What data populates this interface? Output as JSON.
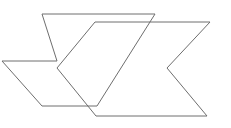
{
  "figure": {
    "canvas": {
      "width": 231,
      "height": 128,
      "background_color": "#ffffff"
    },
    "style": {
      "stroke_color": "#6e6e6e",
      "stroke_width": 1,
      "fill": "none"
    },
    "shapes": [
      {
        "name": "chevron-back",
        "label": "Back chevron",
        "stroke_color": "#6e6e6e",
        "stroke_width": 1,
        "fill": "none",
        "points": "42,14 155,14 97,106 42,106 2,61 57,61",
        "vertices": [
          {
            "name": "top-left",
            "x": 42,
            "y": 14
          },
          {
            "name": "top-right",
            "x": 155,
            "y": 14
          },
          {
            "name": "bottom-right",
            "x": 97,
            "y": 106
          },
          {
            "name": "bottom-left",
            "x": 42,
            "y": 106
          },
          {
            "name": "left-point",
            "x": 2,
            "y": 61
          },
          {
            "name": "inner-notch",
            "x": 57,
            "y": 61
          }
        ]
      },
      {
        "name": "chevron-front",
        "label": "Front chevron",
        "stroke_color": "#6e6e6e",
        "stroke_width": 1,
        "fill": "none",
        "points": "95,22 210,22 167,68 207,116 96,116 57,68",
        "vertices": [
          {
            "name": "top-left",
            "x": 95,
            "y": 22
          },
          {
            "name": "top-right",
            "x": 210,
            "y": 22
          },
          {
            "name": "right-inner-notch",
            "x": 167,
            "y": 68
          },
          {
            "name": "bottom-right",
            "x": 207,
            "y": 116
          },
          {
            "name": "bottom-left",
            "x": 96,
            "y": 116
          },
          {
            "name": "left-point",
            "x": 57,
            "y": 68
          }
        ]
      }
    ]
  }
}
